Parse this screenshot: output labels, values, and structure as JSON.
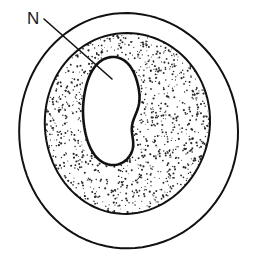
{
  "figure": {
    "background_color": "#ffffff",
    "line_color": "#111111",
    "stipple_color": "#2b2b2b",
    "width": 253,
    "height": 262
  },
  "labels": [
    {
      "id": "nucleus-label",
      "text": "N",
      "meaning": "nucleus",
      "x": 27,
      "y": 24,
      "font_size": 17,
      "color": "#1a1a1a"
    }
  ],
  "leader_lines": [
    {
      "id": "nucleus-leader",
      "from_x": 44,
      "from_y": 19,
      "to_x": 112,
      "to_y": 79,
      "stroke_width": 1.6,
      "color": "#111111"
    }
  ],
  "structures": [
    {
      "id": "outer-boundary",
      "name": "outer-wall",
      "shape": "ellipse",
      "cx": 128,
      "cy": 131,
      "rx": 110,
      "ry": 117,
      "fill": "none",
      "stroke": "#111111",
      "stroke_width": 2.0
    },
    {
      "id": "cytoplasm-outer-boundary",
      "name": "cytoplasm-outer-edge",
      "shape": "ellipse",
      "cx": 127,
      "cy": 123,
      "rx": 83,
      "ry": 90,
      "fill": "stipple",
      "stroke": "#111111",
      "stroke_width": 2.0
    },
    {
      "id": "nucleus-boundary",
      "name": "nucleus",
      "shape": "bean",
      "cx": 112,
      "cy": 111,
      "rx": 29,
      "ry": 54,
      "fill": "#ffffff",
      "stroke": "#111111",
      "stroke_width": 2.6
    }
  ],
  "stipple": {
    "enabled": true,
    "dot_count": 1750,
    "dot_radius_min": 0.45,
    "dot_radius_max": 1.15,
    "color": "#2b2b2b",
    "seed": 20240607
  },
  "legend": {
    "entries": [
      {
        "key": "N",
        "description": "nucleus"
      }
    ]
  }
}
